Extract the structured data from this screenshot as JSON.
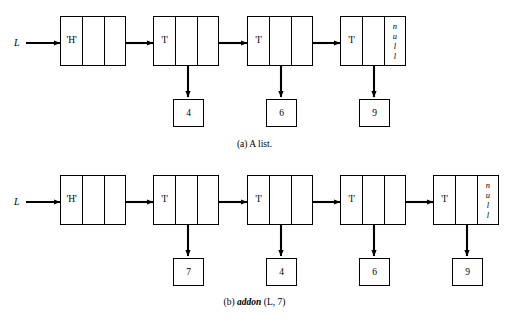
{
  "figure": {
    "background": "#ffffff",
    "ink": "#000000"
  },
  "panels": [
    {
      "id": "a",
      "caption_prefix": "(a)",
      "caption_text": "A list.",
      "caption_op": "",
      "caption_suffix": "",
      "pointer_label": "L",
      "nodes": [
        {
          "label": "'H'",
          "kind": "header",
          "next": "link",
          "data": null
        },
        {
          "label": "'I'",
          "kind": "item",
          "next": "link",
          "data": "4"
        },
        {
          "label": "'I'",
          "kind": "item",
          "next": "link",
          "data": "6"
        },
        {
          "label": "'I'",
          "kind": "item",
          "next": "null",
          "data": "9"
        }
      ],
      "null_glyph": [
        "n",
        "u",
        "l",
        "l"
      ]
    },
    {
      "id": "b",
      "caption_prefix": "(b)",
      "caption_text": "",
      "caption_op": "addon",
      "caption_suffix": "(L, 7)",
      "pointer_label": "L",
      "nodes": [
        {
          "label": "'H'",
          "kind": "header",
          "next": "link",
          "data": null
        },
        {
          "label": "'I'",
          "kind": "item",
          "next": "link",
          "data": "7"
        },
        {
          "label": "'I'",
          "kind": "item",
          "next": "link",
          "data": "4"
        },
        {
          "label": "'I'",
          "kind": "item",
          "next": "link",
          "data": "6"
        },
        {
          "label": "'I'",
          "kind": "item",
          "next": "null",
          "data": "9"
        }
      ],
      "null_glyph": [
        "n",
        "u",
        "l",
        "l"
      ]
    }
  ]
}
